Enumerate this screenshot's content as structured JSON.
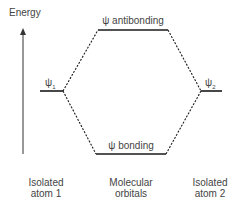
{
  "axis": {
    "label": "Energy"
  },
  "levels": {
    "psi1": {
      "label": "ψ₁",
      "base": "ψ",
      "sub": "1"
    },
    "psi2": {
      "label": "ψ₂",
      "base": "ψ",
      "sub": "2"
    },
    "antibonding": {
      "label": "ψ antibonding"
    },
    "bonding": {
      "label": "ψ bonding"
    }
  },
  "columns": [
    {
      "line1": "Isolated",
      "line2": "atom 1"
    },
    {
      "line1": "Molecular",
      "line2": "orbitals"
    },
    {
      "line1": "Isolated",
      "line2": "atom 2"
    }
  ],
  "colors": {
    "line": "#1a1a1a",
    "text": "#444444"
  }
}
